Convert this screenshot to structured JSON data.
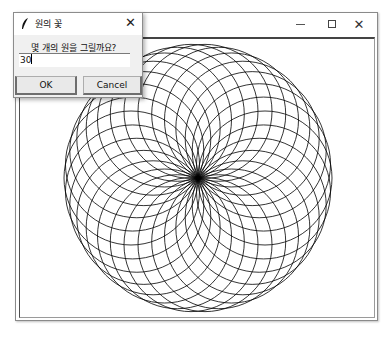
{
  "main_window": {
    "title": "",
    "controls": {
      "minimize": "minimize-icon",
      "maximize": "maximize-icon",
      "close": "close-icon"
    },
    "canvas": {
      "drawing": "circle flower",
      "circle_count": 30,
      "center": [
        198,
        178
      ],
      "circle_radius": 67,
      "stroke_color": "#000000",
      "background": "#ffffff"
    }
  },
  "dialog": {
    "icon": "feather-icon",
    "title": "원의 꽃",
    "close_glyph": "✕",
    "prompt": "몇 개의 원을 그릴까요?",
    "input_value": "30",
    "ok_label": "OK",
    "cancel_label": "Cancel"
  }
}
